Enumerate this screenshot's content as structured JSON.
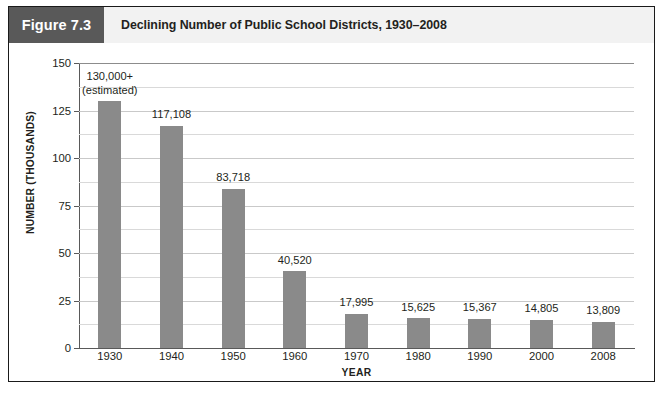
{
  "figure": {
    "number_label": "Figure 7.3",
    "title": "Declining Number of Public School Districts, 1930–2008",
    "number_box_color": "#595959",
    "header_bg_color": "#f2f2f2",
    "bar_color": "#8a8a8a"
  },
  "chart_data": {
    "type": "bar",
    "title": "Declining Number of Public School Districts, 1930–2008",
    "xlabel": "YEAR",
    "ylabel": "NUMBER (THOUSANDS)",
    "ylim": [
      0,
      150
    ],
    "ytick_labels": [
      "0",
      "25",
      "50",
      "75",
      "100",
      "125",
      "150"
    ],
    "ytick_values": [
      0,
      25,
      50,
      75,
      100,
      125,
      150
    ],
    "minor_gridline_values": [
      12.5,
      37.5,
      62.5,
      87.5,
      112.5,
      137.5
    ],
    "grid": true,
    "legend": "none",
    "categories": [
      "1930",
      "1940",
      "1950",
      "1960",
      "1970",
      "1980",
      "1990",
      "2000",
      "2008"
    ],
    "values": [
      130.0,
      117.108,
      83.718,
      40.52,
      17.995,
      15.625,
      15.367,
      14.805,
      13.809
    ],
    "data_labels": [
      "130,000+\n(estimated)",
      "117,108",
      "83,718",
      "40,520",
      "17,995",
      "15,625",
      "15,367",
      "14,805",
      "13,809"
    ],
    "data_label_line1": [
      "130,000+",
      "117,108",
      "83,718",
      "40,520",
      "17,995",
      "15,625",
      "15,367",
      "14,805",
      "13,809"
    ],
    "data_label_line2": [
      "(estimated)",
      "",
      "",
      "",
      "",
      "",
      "",
      "",
      ""
    ]
  }
}
